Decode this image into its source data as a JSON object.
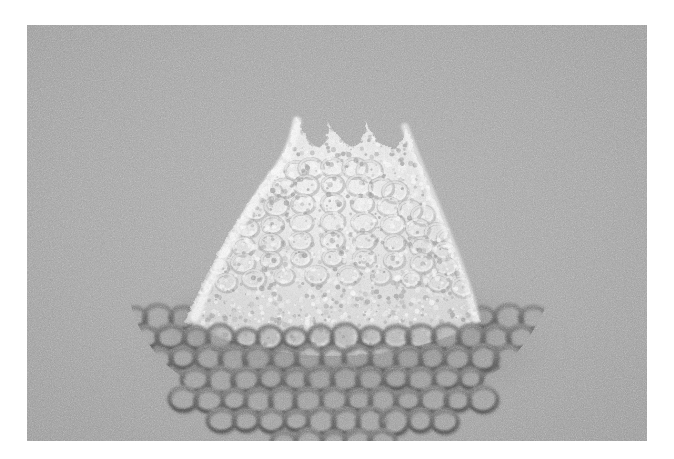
{
  "figure": {
    "domain_label": "scanning-electron-micrograph-style render",
    "title": "",
    "caption": "",
    "background_color": "#ffffff",
    "panel": {
      "name": "micrograph-panel",
      "x": 27,
      "y": 25,
      "width": 620,
      "height": 416,
      "substrate_color": "#a9a9a9",
      "substrate_color_light": "#b4b4b4",
      "substrate_color_dark": "#9d9d9d",
      "grain": {
        "present": true,
        "strength": 0.55,
        "type": "monochrome-speckle"
      }
    },
    "objects": [
      {
        "id": "base-lattice",
        "name": "hexagonal-ring-lattice-sheet",
        "description": "flat fan-shaped sheet of interlinked rings lying on the substrate",
        "color_ring": "#6e6e6e",
        "color_ring_shadow": "#5a5a5a",
        "color_ring_hole": "#a2a2a2",
        "ring_count_visible": 96,
        "ring_outer_radius_px": 13,
        "ring_thickness_px": 4,
        "bounds": {
          "left": 127,
          "right": 548,
          "top": 258,
          "bottom": 392
        }
      },
      {
        "id": "cone",
        "name": "bright-granular-cone",
        "description": "bright, rough, granular cone/dome of the same ring mesh rising from the sheet centre; twin peaks with a saddle notch between them",
        "color_highlight": "#f2f2f2",
        "color_midtone": "#d2d2d2",
        "color_seam": "#8f8f8f",
        "apex_left": {
          "x": 296,
          "y": 117
        },
        "apex_right": {
          "x": 358,
          "y": 120
        },
        "saddle": {
          "x": 327,
          "y": 131
        },
        "bounds": {
          "left": 186,
          "right": 464,
          "top": 112,
          "bottom": 322
        }
      }
    ],
    "annotations": [],
    "scale_bar": null,
    "labels": []
  }
}
